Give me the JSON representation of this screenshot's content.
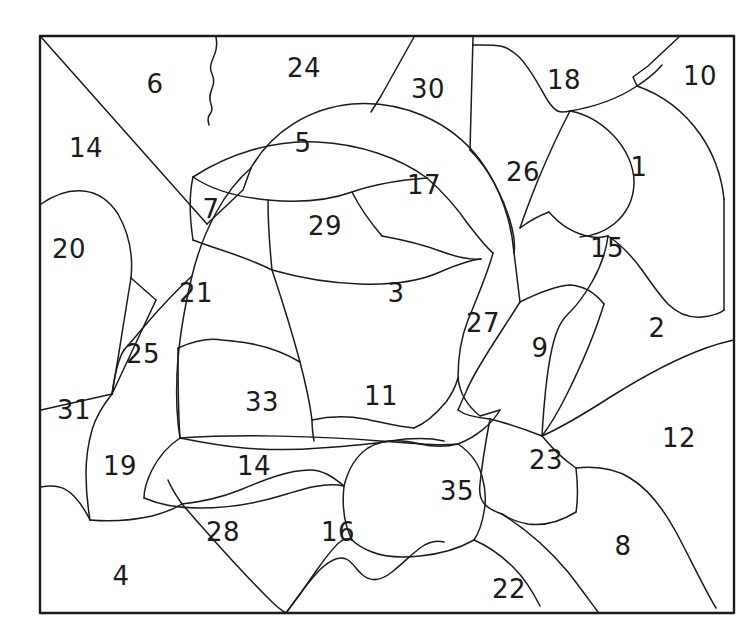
{
  "page": {
    "background_color": "#ffffff",
    "line_color": "#1b1b1b",
    "frame": {
      "x": 40,
      "y": 36,
      "width": 694,
      "height": 577,
      "stroke_width": 2.4
    }
  },
  "artwork": {
    "subject": "turtle",
    "type": "color-by-number-outline",
    "region_count": 35
  },
  "regions": [
    {
      "number": "6",
      "x": 155,
      "y": 84
    },
    {
      "number": "24",
      "x": 304,
      "y": 68
    },
    {
      "number": "30",
      "x": 428,
      "y": 89
    },
    {
      "number": "18",
      "x": 564,
      "y": 80
    },
    {
      "number": "10",
      "x": 700,
      "y": 76
    },
    {
      "number": "14",
      "x": 86,
      "y": 148
    },
    {
      "number": "5",
      "x": 303,
      "y": 143
    },
    {
      "number": "17",
      "x": 424,
      "y": 185
    },
    {
      "number": "26",
      "x": 523,
      "y": 172
    },
    {
      "number": "1",
      "x": 639,
      "y": 167
    },
    {
      "number": "7",
      "x": 211,
      "y": 209
    },
    {
      "number": "29",
      "x": 325,
      "y": 226
    },
    {
      "number": "20",
      "x": 69,
      "y": 249
    },
    {
      "number": "15",
      "x": 607,
      "y": 248
    },
    {
      "number": "21",
      "x": 196,
      "y": 293
    },
    {
      "number": "3",
      "x": 396,
      "y": 293
    },
    {
      "number": "2",
      "x": 657,
      "y": 328
    },
    {
      "number": "27",
      "x": 483,
      "y": 323
    },
    {
      "number": "25",
      "x": 143,
      "y": 354
    },
    {
      "number": "9",
      "x": 540,
      "y": 348
    },
    {
      "number": "33",
      "x": 262,
      "y": 402
    },
    {
      "number": "11",
      "x": 381,
      "y": 396
    },
    {
      "number": "31",
      "x": 74,
      "y": 410
    },
    {
      "number": "12",
      "x": 679,
      "y": 438
    },
    {
      "number": "23",
      "x": 546,
      "y": 460
    },
    {
      "number": "19",
      "x": 120,
      "y": 466
    },
    {
      "number": "14",
      "x": 254,
      "y": 466
    },
    {
      "number": "35",
      "x": 457,
      "y": 491
    },
    {
      "number": "28",
      "x": 223,
      "y": 532
    },
    {
      "number": "16",
      "x": 338,
      "y": 532
    },
    {
      "number": "8",
      "x": 623,
      "y": 546
    },
    {
      "number": "4",
      "x": 121,
      "y": 576
    },
    {
      "number": "22",
      "x": 509,
      "y": 589
    }
  ]
}
